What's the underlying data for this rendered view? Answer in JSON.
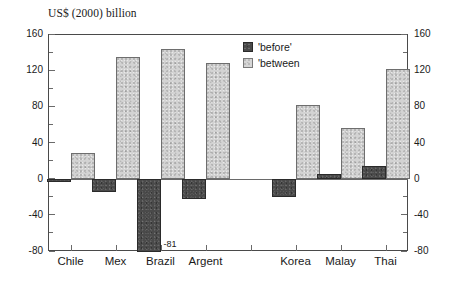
{
  "chart_data": {
    "type": "bar",
    "title": "US$ (2000) billion",
    "xlabel": "",
    "ylabel": "",
    "ylim": [
      -80,
      160
    ],
    "ytick_step": 40,
    "yminor_step": 20,
    "grid": false,
    "legend_position": "upper-center-right",
    "categories": [
      "Chile",
      "Mex",
      "Brazil",
      "Argent",
      "Korea",
      "Malay",
      "Thai"
    ],
    "category_groups": [
      {
        "name": "Latin America",
        "categories": [
          "Chile",
          "Mex",
          "Brazil",
          "Argent"
        ]
      },
      {
        "name": "Asia",
        "categories": [
          "Korea",
          "Malay",
          "Thai"
        ]
      }
    ],
    "series": [
      {
        "name": "'before'",
        "color": "#4a4a4a",
        "values": [
          -4,
          -15,
          -81,
          -22,
          -20,
          5,
          14
        ]
      },
      {
        "name": "'between",
        "color": "#d3d3d3",
        "values": [
          28,
          135,
          143,
          128,
          82,
          56,
          121
        ]
      }
    ],
    "annotations": [
      {
        "text": "-81",
        "category": "Brazil",
        "series": "'before'",
        "value": -81
      }
    ],
    "axis_left_ticks": [
      "160",
      "120",
      "80",
      "40",
      "0",
      "-40",
      "-80"
    ],
    "axis_right_ticks": [
      "160",
      "120",
      "80",
      "40",
      "0",
      "-40",
      "-80"
    ]
  },
  "legend": {
    "items": [
      {
        "label": "'before'",
        "swatch": "dark-dotted-swatch"
      },
      {
        "label": "'between",
        "swatch": "light-dotted-swatch"
      }
    ]
  }
}
